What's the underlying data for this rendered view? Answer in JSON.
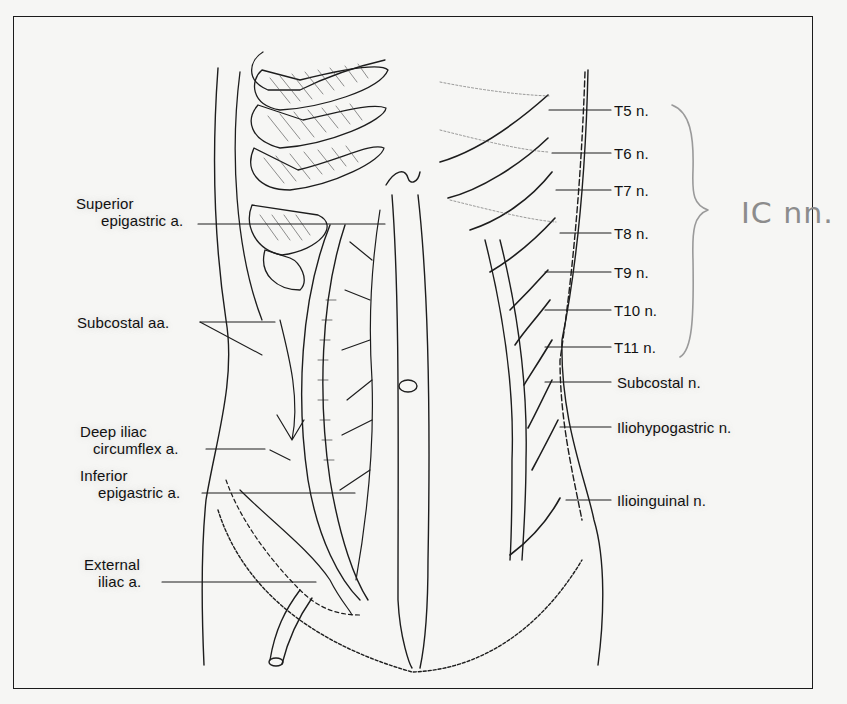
{
  "figure": {
    "left_labels": [
      {
        "id": "superior-epigastric",
        "line1": "Superior",
        "line2": "epigastric a."
      },
      {
        "id": "subcostal-aa",
        "line1": "Subcostal aa.",
        "line2": ""
      },
      {
        "id": "deep-iliac-circumflex",
        "line1": "Deep iliac",
        "line2": "circumflex a."
      },
      {
        "id": "inferior-epigastric",
        "line1": "Inferior",
        "line2": "epigastric a."
      },
      {
        "id": "external-iliac",
        "line1": "External",
        "line2": "iliac a."
      }
    ],
    "right_labels": [
      {
        "id": "t5",
        "text": "T5 n."
      },
      {
        "id": "t6",
        "text": "T6 n."
      },
      {
        "id": "t7",
        "text": "T7 n."
      },
      {
        "id": "t8",
        "text": "T8 n."
      },
      {
        "id": "t9",
        "text": "T9 n."
      },
      {
        "id": "t10",
        "text": "T10 n."
      },
      {
        "id": "t11",
        "text": "T11 n."
      },
      {
        "id": "subcostal-n",
        "text": "Subcostal n."
      },
      {
        "id": "iliohypogastric",
        "text": "Iliohypogastric n."
      },
      {
        "id": "ilioinguinal",
        "text": "Ilioinguinal n."
      }
    ],
    "annotation": {
      "bracket_covers": "T5–T11",
      "handwritten_text": "IC nn."
    }
  }
}
